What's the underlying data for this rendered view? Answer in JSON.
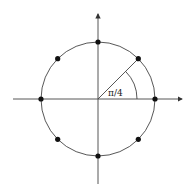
{
  "diagram": {
    "type": "unit-circle",
    "angle_label": "π/4",
    "colors": {
      "stroke": "#333333",
      "point": "#111111",
      "background": "#ffffff"
    },
    "points_count": 8,
    "points_angles": [
      "0",
      "π/4",
      "π/2",
      "3π/4",
      "π",
      "5π/4",
      "3π/2",
      "7π/4"
    ]
  }
}
